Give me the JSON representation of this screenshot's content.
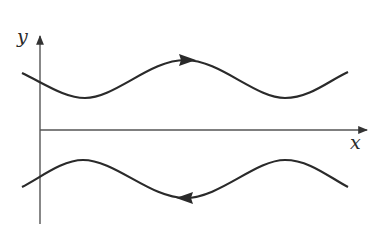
{
  "diagram": {
    "type": "phase-plane-flow",
    "colors": {
      "stroke": "#2a2a2a",
      "axis": "#555555",
      "background": "#ffffff"
    },
    "axes": {
      "x_label": "x",
      "y_label": "y"
    },
    "curves": [
      {
        "name": "upper-trajectory",
        "shape": "wave",
        "direction": "right"
      },
      {
        "name": "lower-trajectory",
        "shape": "wave",
        "direction": "left"
      }
    ]
  }
}
